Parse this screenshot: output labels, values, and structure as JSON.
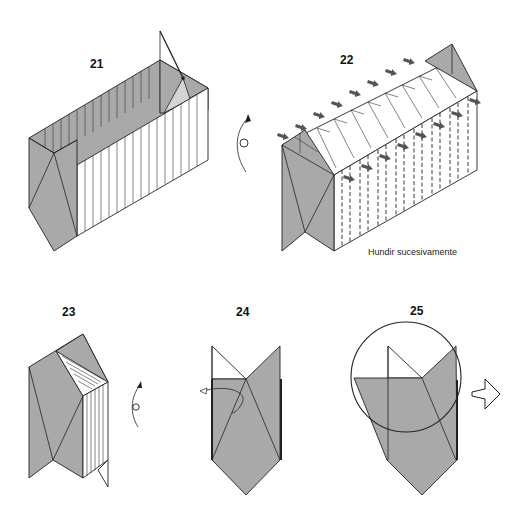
{
  "diagram": {
    "colors": {
      "paper_colored": "#a9a9a9",
      "paper_white": "#ffffff",
      "line": "#222222",
      "arrow": "#555555"
    },
    "steps": [
      {
        "number": "21",
        "caption": "",
        "icons": [
          "turn-over-icon",
          "open-flap-arrow"
        ]
      },
      {
        "number": "22",
        "caption": "Hundir sucesivamente",
        "icons": [
          "push-arrow-icon"
        ],
        "push_arrow_count": 16
      },
      {
        "number": "23",
        "caption": "",
        "icons": [
          "turn-over-icon"
        ]
      },
      {
        "number": "24",
        "caption": "",
        "icons": [
          "fold-behind-arrow"
        ]
      },
      {
        "number": "25",
        "caption": "",
        "icons": [
          "zoom-circle",
          "next-view-arrow-icon"
        ]
      }
    ]
  }
}
